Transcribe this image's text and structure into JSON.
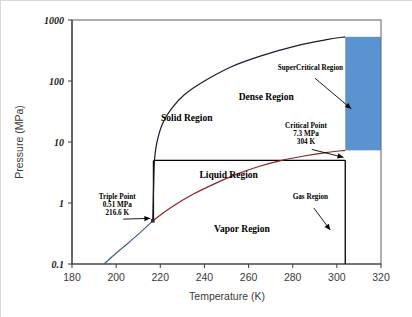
{
  "chart_data": {
    "type": "line",
    "title": "",
    "xlabel": "Temperature (K)",
    "ylabel": "Pressure (MPa)",
    "xlim": [
      180,
      320
    ],
    "ylim": [
      0.1,
      1000
    ],
    "yscale": "log",
    "xticks": [
      180,
      200,
      220,
      240,
      260,
      280,
      300,
      320
    ],
    "yticks": [
      "0.1",
      "1",
      "10",
      "100",
      "1000"
    ],
    "ytick_values": [
      0.1,
      1,
      10,
      100,
      1000
    ],
    "grid": false,
    "legend": "none",
    "substance_points": {
      "triple_point": {
        "T": 216.6,
        "P": 0.51
      },
      "critical_point": {
        "T": 304,
        "P": 7.3
      }
    },
    "series": [
      {
        "name": "Sublimation curve (solid-vapor)",
        "color": "#3f5f86",
        "points": [
          [
            194.5,
            0.1
          ],
          [
            200,
            0.15
          ],
          [
            206,
            0.23
          ],
          [
            211,
            0.33
          ],
          [
            216.6,
            0.51
          ]
        ]
      },
      {
        "name": "Melting curve (solid-liquid)",
        "color": "#1b1b2e",
        "points": [
          [
            216.6,
            0.51
          ],
          [
            217.0,
            2.0
          ],
          [
            217.4,
            5.2
          ],
          [
            218.5,
            10
          ],
          [
            221,
            20
          ],
          [
            225,
            35
          ],
          [
            231,
            60
          ],
          [
            240,
            100
          ],
          [
            252,
            170
          ],
          [
            266,
            260
          ],
          [
            282,
            380
          ],
          [
            296,
            480
          ],
          [
            303.8,
            530
          ]
        ]
      },
      {
        "name": "Vaporization curve (liquid-vapor)",
        "color": "#8b2321",
        "points": [
          [
            216.6,
            0.51
          ],
          [
            225,
            0.85
          ],
          [
            235,
            1.4
          ],
          [
            245,
            2.1
          ],
          [
            255,
            3.0
          ],
          [
            265,
            4.0
          ],
          [
            275,
            5.0
          ],
          [
            285,
            5.9
          ],
          [
            295,
            6.7
          ],
          [
            303.8,
            7.3
          ]
        ]
      }
    ],
    "shaded_regions": [
      {
        "name": "supercritical-shading",
        "color": "#5b92d0",
        "x_range": [
          303.8,
          320
        ],
        "y_range": [
          7.3,
          530
        ]
      }
    ],
    "guide_lines": [
      {
        "name": "critical-isobar",
        "orientation": "horizontal",
        "value": 5.0,
        "from": 217.4,
        "to": 303.8
      },
      {
        "name": "triple-point-isotherm",
        "orientation": "vertical",
        "value": 216.9,
        "from": 0.51,
        "to": 5.0
      },
      {
        "name": "critical-isotherm",
        "orientation": "vertical",
        "value": 303.8,
        "from": 0.1,
        "to": 5.0
      }
    ],
    "region_labels": [
      {
        "name": "solid-region",
        "text": "Solid Region",
        "T": 232,
        "P": 22
      },
      {
        "name": "dense-region",
        "text": "Dense Region",
        "T": 268,
        "P": 48
      },
      {
        "name": "liquid-region",
        "text": "Liquid Region",
        "T": 251,
        "P": 2.6
      },
      {
        "name": "vapor-region",
        "text": "Vapor Region",
        "T": 257,
        "P": 0.33
      }
    ],
    "annotations": [
      {
        "name": "supercritical-region",
        "lines": [
          "SuperCritical  Region"
        ],
        "T": 288,
        "P": 150,
        "arrow_to": {
          "T": 306.5,
          "P": 35
        }
      },
      {
        "name": "critical-point",
        "lines": [
          "Critical Point",
          "7.3 MPa",
          "304   K"
        ],
        "T": 286,
        "P": 17,
        "arrow_to": {
          "T": 303,
          "P": 5.6
        }
      },
      {
        "name": "triple-point",
        "lines": [
          "Triple Point",
          "0.51 MPa",
          "216.6 K"
        ],
        "T": 200.5,
        "P": 1.15,
        "arrow_to": {
          "T": 215.5,
          "P": 0.56
        }
      },
      {
        "name": "gas-region",
        "lines": [
          "Gas Region"
        ],
        "T": 288,
        "P": 1.15,
        "arrow_to": {
          "T": 297,
          "P": 0.36
        }
      }
    ]
  }
}
